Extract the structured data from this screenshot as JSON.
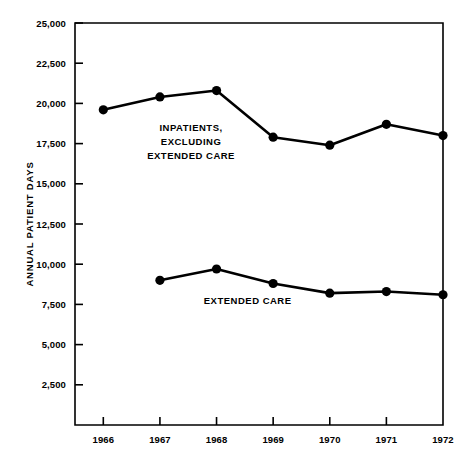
{
  "chart_data": {
    "type": "line",
    "title": "",
    "xlabel": "",
    "ylabel": "ANNUAL PATIENT DAYS",
    "categories": [
      "1966",
      "1967",
      "1968",
      "1969",
      "1970",
      "1971",
      "1972"
    ],
    "x": [
      1966,
      1967,
      1968,
      1969,
      1970,
      1971,
      1972
    ],
    "xlim": [
      1965.5,
      1972.0
    ],
    "ylim": [
      0,
      25000
    ],
    "ytick_values": [
      2500,
      5000,
      7500,
      10000,
      12500,
      15000,
      17500,
      20000,
      22500,
      25000
    ],
    "ytick_labels": [
      "2,500",
      "5,000",
      "7,500",
      "10,000",
      "12,500",
      "15,000",
      "17,500",
      "20,000",
      "22,500",
      "25,000"
    ],
    "xtick_labels": [
      "1966",
      "1967",
      "1968",
      "1969",
      "1970",
      "1971",
      "1972"
    ],
    "grid": false,
    "legend_position": "inline-annotation",
    "series": [
      {
        "name": "INPATIENTS, EXCLUDING EXTENDED CARE",
        "x": [
          1966,
          1967,
          1968,
          1969,
          1970,
          1971,
          1972
        ],
        "values": [
          19600,
          20400,
          20800,
          17900,
          17400,
          18700,
          18000
        ],
        "marker": "filled-circle",
        "color": "#000000"
      },
      {
        "name": "EXTENDED CARE",
        "x": [
          1967,
          1968,
          1969,
          1970,
          1971,
          1972
        ],
        "values": [
          9000,
          9700,
          8800,
          8200,
          8300,
          8100
        ],
        "marker": "filled-circle",
        "color": "#000000"
      }
    ],
    "annotations": [
      {
        "id": "inpatients-annotation",
        "lines": [
          "INPATIENTS,",
          "EXCLUDING",
          "EXTENDED CARE"
        ],
        "x": 1967.55,
        "y": 18300
      },
      {
        "id": "extended-care-annotation",
        "lines": [
          "EXTENDED CARE"
        ],
        "x": 1968.55,
        "y": 7500
      }
    ]
  },
  "axes": {
    "y_title": "ANNUAL PATIENT DAYS"
  }
}
